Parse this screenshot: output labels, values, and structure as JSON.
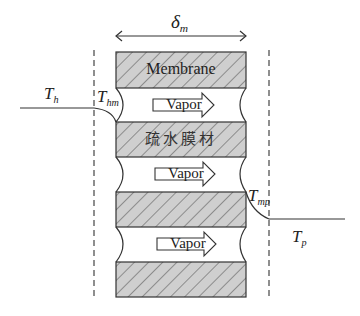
{
  "diagram": {
    "thickness_label": {
      "symbol": "δ",
      "subscript": "m"
    },
    "membrane_label": "Membrane",
    "material_label": "疏水膜材",
    "vapor_labels": [
      "Vapor",
      "Vapor",
      "Vapor"
    ],
    "temperatures": {
      "hot_bulk": {
        "symbol": "T",
        "subscript": "h"
      },
      "hot_membrane": {
        "symbol": "T",
        "subscript": "hm"
      },
      "permeate_membrane": {
        "symbol": "T",
        "subscript": "mp"
      },
      "permeate_bulk": {
        "symbol": "T",
        "subscript": "p"
      }
    },
    "colors": {
      "block_fill": "#cfcfcf",
      "hatch": "#555555",
      "stroke": "#333333",
      "background": "#ffffff"
    }
  }
}
